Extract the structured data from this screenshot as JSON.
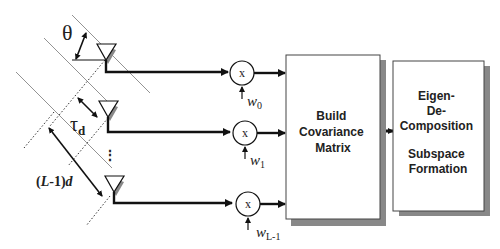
{
  "labels": {
    "theta": "θ",
    "tau": "τ",
    "tau_sub": "d",
    "aperture_pre": "(",
    "aperture_L": "L",
    "aperture_post": "-1)",
    "aperture_d": "d",
    "ellipsis": "⋮"
  },
  "multipliers": [
    {
      "symbol": "x",
      "weight": "w",
      "weight_sub": "0"
    },
    {
      "symbol": "x",
      "weight": "w",
      "weight_sub": "1"
    },
    {
      "symbol": "x",
      "weight": "w",
      "weight_sub": "L-1"
    }
  ],
  "blocks": {
    "covariance": {
      "lines": [
        "Build",
        "Covariance",
        "Matrix"
      ]
    },
    "eigen": {
      "lines": [
        "Eigen-",
        "De-",
        "Composition",
        "",
        "Subspace",
        "Formation"
      ]
    }
  },
  "colors": {
    "line": "#111111",
    "shadow": "#8a8a8a",
    "thin": "#777777"
  }
}
